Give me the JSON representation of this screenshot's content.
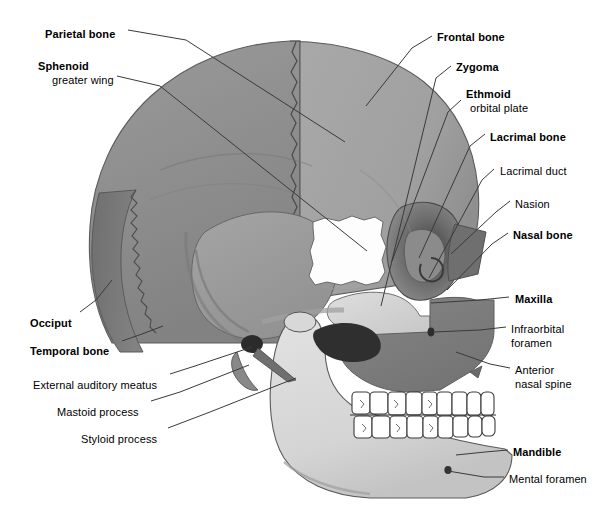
{
  "figure": {
    "background": "#ffffff",
    "line_color": "#3a3a3a",
    "text_color": "#000000"
  },
  "palette": {
    "parietal": "#8e8e8e",
    "frontal": "#a6a6a6",
    "occipital": "#7a7a7a",
    "temporal": "#9a9a9a",
    "sphenoid_white": "#fdfdfd",
    "zygoma": "#d6d6d6",
    "maxilla": "#7e7e7e",
    "nasal": "#707070",
    "mandible": "#dcdcdc",
    "teeth": "#ffffff",
    "orbit_shadow": "#5a5a5a",
    "outline": "#4a4a4a"
  },
  "labels_left": [
    {
      "id": "parietal-bone",
      "text": "Parietal bone",
      "bold": true,
      "x": 45,
      "y": 28
    },
    {
      "id": "sphenoid",
      "text": "Sphenoid",
      "bold": true,
      "x": 38,
      "y": 60
    },
    {
      "id": "greater-wing",
      "text": "greater wing",
      "bold": false,
      "x": 52,
      "y": 74
    },
    {
      "id": "occiput",
      "text": "Occiput",
      "bold": true,
      "x": 30,
      "y": 317
    },
    {
      "id": "temporal-bone",
      "text": "Temporal bone",
      "bold": true,
      "x": 30,
      "y": 345
    },
    {
      "id": "external-auditory-meatus",
      "text": "External auditory meatus",
      "bold": false,
      "x": 33,
      "y": 379
    },
    {
      "id": "mastoid-process",
      "text": "Mastoid process",
      "bold": false,
      "x": 57,
      "y": 406
    },
    {
      "id": "styloid-process",
      "text": "Styloid process",
      "bold": false,
      "x": 81,
      "y": 433
    }
  ],
  "labels_right": [
    {
      "id": "frontal-bone",
      "text": "Frontal bone",
      "bold": true,
      "x": 437,
      "y": 31
    },
    {
      "id": "zygoma",
      "text": "Zygoma",
      "bold": true,
      "x": 456,
      "y": 61
    },
    {
      "id": "ethmoid",
      "text": "Ethmoid",
      "bold": true,
      "x": 466,
      "y": 88
    },
    {
      "id": "orbital-plate",
      "text": "orbital plate",
      "bold": false,
      "x": 470,
      "y": 102
    },
    {
      "id": "lacrimal-bone",
      "text": "Lacrimal bone",
      "bold": true,
      "x": 490,
      "y": 131
    },
    {
      "id": "lacrimal-duct",
      "text": "Lacrimal duct",
      "bold": false,
      "x": 500,
      "y": 165
    },
    {
      "id": "nasion",
      "text": "Nasion",
      "bold": false,
      "x": 515,
      "y": 198
    },
    {
      "id": "nasal-bone",
      "text": "Nasal bone",
      "bold": true,
      "x": 513,
      "y": 229
    },
    {
      "id": "maxilla",
      "text": "Maxilla",
      "bold": true,
      "x": 515,
      "y": 293
    },
    {
      "id": "infraorbital",
      "text": "Infraorbital",
      "bold": false,
      "x": 511,
      "y": 323
    },
    {
      "id": "foramen",
      "text": "foramen",
      "bold": false,
      "x": 511,
      "y": 337
    },
    {
      "id": "anterior",
      "text": "Anterior",
      "bold": false,
      "x": 515,
      "y": 364
    },
    {
      "id": "nasal-spine",
      "text": "nasal spine",
      "bold": false,
      "x": 515,
      "y": 378
    },
    {
      "id": "mandible",
      "text": "Mandible",
      "bold": true,
      "x": 513,
      "y": 446
    },
    {
      "id": "mental-foramen",
      "text": "Mental foramen",
      "bold": false,
      "x": 509,
      "y": 473
    }
  ],
  "leader_lines": [
    {
      "id": "leader-parietal",
      "points": "128,30 186,40 345,142"
    },
    {
      "id": "leader-sphenoid",
      "points": "117,76 160,86 367,251"
    },
    {
      "id": "leader-occiput",
      "points": "80,312 96,300 112,280"
    },
    {
      "id": "leader-temporal",
      "points": "122,341 142,334 163,326"
    },
    {
      "id": "leader-eam",
      "points": "170,374 195,366 252,347"
    },
    {
      "id": "leader-mastoid",
      "points": "151,401 180,392 249,365"
    },
    {
      "id": "leader-styloid",
      "points": "168,428 210,412 296,378"
    },
    {
      "id": "leader-frontal",
      "points": "432,36 412,48 366,106"
    },
    {
      "id": "leader-zygoma",
      "points": "451,66 436,78 381,306"
    },
    {
      "id": "leader-ethmoid",
      "points": "461,100 448,112 392,261"
    },
    {
      "id": "leader-lacrimal-bone",
      "points": "485,134 470,146 419,258"
    },
    {
      "id": "leader-lacrimal-duct",
      "points": "494,169 482,180 429,278"
    },
    {
      "id": "leader-nasion",
      "points": "510,201 496,212 451,254"
    },
    {
      "id": "leader-nasal",
      "points": "508,233 492,244 447,290"
    },
    {
      "id": "leader-maxilla",
      "points": "509,297 480,300 431,303"
    },
    {
      "id": "leader-infraorbital",
      "points": "506,327 480,330 433,332"
    },
    {
      "id": "leader-anterior",
      "points": "510,368 490,364 456,352"
    },
    {
      "id": "leader-mandible",
      "points": "508,450 485,452 456,455"
    },
    {
      "id": "leader-mental",
      "points": "504,477 484,477 448,471"
    }
  ]
}
